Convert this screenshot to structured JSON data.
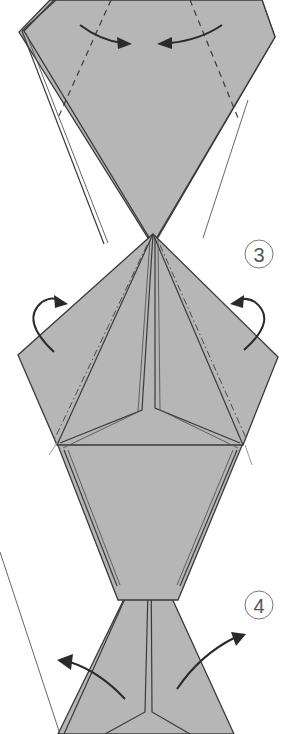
{
  "figure": {
    "type": "origami-folding-diagram",
    "background": "#ffffff",
    "paper_color": "#b6b6b6",
    "line_color": "#3a3a3a"
  },
  "steps": [
    {
      "id": "step-2-partial",
      "label": "",
      "instruction_symbols": [
        "valley-fold-dashed-lines",
        "fold-in-arrows-left-right"
      ]
    },
    {
      "id": "step-3",
      "label": "3",
      "instruction_symbols": [
        "mountain-fold-dash-dot-lines",
        "fold-behind-arrows-left-right"
      ]
    },
    {
      "id": "step-4",
      "label": "4",
      "instruction_symbols": [
        "open-out-arrows-left-right"
      ]
    }
  ]
}
